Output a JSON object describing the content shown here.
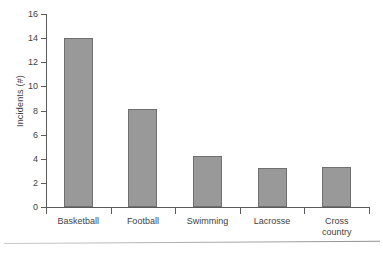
{
  "chart_data": {
    "type": "bar",
    "title": "",
    "subtitle": "",
    "xlabel": "",
    "ylabel": "Incidents (#)",
    "categories": [
      "Basketball",
      "Football",
      "Swimming",
      "Lacrosse",
      "Cross\ncountry"
    ],
    "values": [
      14.0,
      8.1,
      4.2,
      3.2,
      3.3
    ],
    "ylim": [
      0,
      16
    ],
    "yticks": [
      0,
      2,
      4,
      6,
      8,
      10,
      12,
      14,
      16
    ],
    "ytick_labels": [
      "0",
      "2",
      "4",
      "6",
      "8",
      "10",
      "12",
      "14",
      "16"
    ],
    "grid": false,
    "legend": null,
    "bar_color": "#999999",
    "bar_border_color": "#6f6f6f",
    "axis_color": "#5a5a5a",
    "background": "#ffffff"
  },
  "figure": {
    "y_axis_title": "Incidents (#)",
    "bottom_rule": ""
  }
}
